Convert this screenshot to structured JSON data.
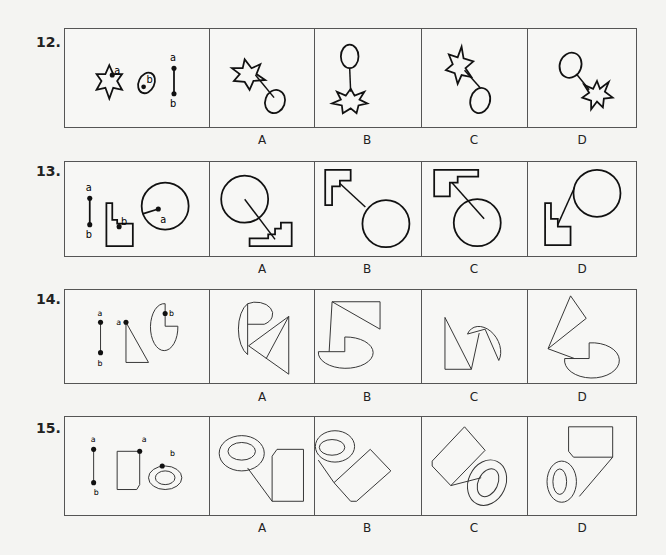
{
  "questions": [
    {
      "number": "12.",
      "given_labels": {
        "point_a": "a",
        "point_b": "b",
        "seg_a": "a",
        "seg_b": "b"
      },
      "given_shapes": [
        "six-pointed-star",
        "ellipse",
        "line-segment"
      ],
      "options": [
        {
          "label": "A"
        },
        {
          "label": "B"
        },
        {
          "label": "C"
        },
        {
          "label": "D"
        }
      ]
    },
    {
      "number": "13.",
      "given_labels": {
        "seg_a": "a",
        "seg_b": "b",
        "point_b": "b",
        "point_a": "a"
      },
      "given_shapes": [
        "line-segment",
        "stepped-l-shape",
        "circle"
      ],
      "options": [
        {
          "label": "A"
        },
        {
          "label": "B"
        },
        {
          "label": "C"
        },
        {
          "label": "D"
        }
      ]
    },
    {
      "number": "14.",
      "given_labels": {
        "seg_a": "a",
        "seg_b": "b",
        "point_a": "a",
        "point_b": "b"
      },
      "given_shapes": [
        "line-segment",
        "right-triangle",
        "pac-man-ellipse"
      ],
      "options": [
        {
          "label": "A"
        },
        {
          "label": "B"
        },
        {
          "label": "C"
        },
        {
          "label": "D"
        }
      ]
    },
    {
      "number": "15.",
      "given_labels": {
        "seg_a": "a",
        "seg_b": "b",
        "point_a": "a",
        "point_b": "b"
      },
      "given_shapes": [
        "line-segment",
        "clipped-rectangle",
        "ring-ellipse"
      ],
      "options": [
        {
          "label": "A"
        },
        {
          "label": "B"
        },
        {
          "label": "C"
        },
        {
          "label": "D"
        }
      ]
    }
  ],
  "colors": {
    "stroke": "#111111",
    "border": "#555555",
    "background": "#f4f4f2"
  }
}
